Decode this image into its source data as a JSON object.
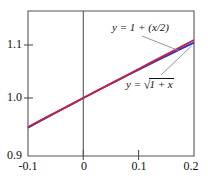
{
  "figure": {
    "background_color": "#ffffff",
    "frame_color": "#555555",
    "axis_color": "#555555",
    "text_color": "#111111"
  },
  "axes": {
    "x_ticks": [
      "-0.1",
      "0",
      "0.1",
      "0.2"
    ],
    "x_tick_values": [
      -0.1,
      0,
      0.1,
      0.2
    ],
    "y_ticks": [
      "1.1",
      "1.0",
      "0.9"
    ],
    "y_tick_values": [
      1.1,
      1.0,
      0.9
    ],
    "xlim": [
      -0.1,
      0.2
    ],
    "ylim": [
      0.9,
      1.15
    ]
  },
  "labels": {
    "linear": "y = 1 + (x/2)",
    "sqrt_prefix": "y = ",
    "sqrt_radical": "√",
    "sqrt_arg": "1 + x",
    "sqrt_full": "y = √(1 + x)"
  },
  "chart_data": {
    "type": "line",
    "title": "",
    "xlabel": "",
    "ylabel": "",
    "xlim": [
      -0.1,
      0.2
    ],
    "ylim": [
      0.9,
      1.15
    ],
    "grid": false,
    "legend": "inline-annotations",
    "x": [
      -0.1,
      -0.08,
      -0.06,
      -0.04,
      -0.02,
      0,
      0.02,
      0.04,
      0.06,
      0.08,
      0.1,
      0.12,
      0.14,
      0.16,
      0.18,
      0.2
    ],
    "series": [
      {
        "name": "y = 1 + (x/2)",
        "color": "#c0224a",
        "type": "line",
        "values": [
          0.95,
          0.96,
          0.97,
          0.98,
          0.99,
          1.0,
          1.01,
          1.02,
          1.03,
          1.04,
          1.05,
          1.06,
          1.07,
          1.08,
          1.09,
          1.1
        ]
      },
      {
        "name": "y = √(1 + x)",
        "color": "#2b35c8",
        "type": "line",
        "values": [
          0.94868,
          0.95917,
          0.96954,
          0.9798,
          0.98995,
          1.0,
          1.00995,
          1.0198,
          1.02956,
          1.03923,
          1.04881,
          1.0583,
          1.06771,
          1.07703,
          1.08628,
          1.09545
        ]
      }
    ],
    "annotations": [
      {
        "text": "y = 1 + (x/2)",
        "points_to_series": "y = 1 + (x/2)",
        "at_x": 0.185
      },
      {
        "text": "y = √(1 + x)",
        "points_to_series": "y = √(1 + x)",
        "at_x": 0.2
      }
    ]
  }
}
